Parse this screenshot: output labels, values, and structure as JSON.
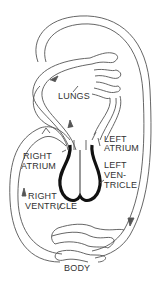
{
  "diagram": {
    "title": "",
    "type": "circulatory-system-schematic",
    "colors": {
      "line": "#555555",
      "heart_wall": "#111111",
      "text": "#333333",
      "background": "#ffffff"
    },
    "labels": {
      "lungs": "LUNGS",
      "left_atrium_1": "LEFT",
      "left_atrium_2": "ATRIUM",
      "right_atrium_1": "RIGHT",
      "right_atrium_2": "ATRIUM",
      "left_ventricle_1": "LEFT",
      "left_ventricle_2": "VEN-",
      "left_ventricle_3": "TRICLE",
      "right_ventricle_1": "RIGHT",
      "right_ventricle_2": "VENTRICLE",
      "body": "BODY"
    },
    "nodes": [
      "LUNGS",
      "LEFT ATRIUM",
      "LEFT VENTRICLE",
      "RIGHT ATRIUM",
      "RIGHT VENTRICLE",
      "BODY"
    ],
    "edges": [
      {
        "from": "RIGHT VENTRICLE",
        "to": "LUNGS"
      },
      {
        "from": "LUNGS",
        "to": "LEFT ATRIUM"
      },
      {
        "from": "LEFT ATRIUM",
        "to": "LEFT VENTRICLE"
      },
      {
        "from": "LEFT VENTRICLE",
        "to": "BODY"
      },
      {
        "from": "BODY",
        "to": "RIGHT ATRIUM"
      },
      {
        "from": "RIGHT ATRIUM",
        "to": "RIGHT VENTRICLE"
      }
    ]
  }
}
